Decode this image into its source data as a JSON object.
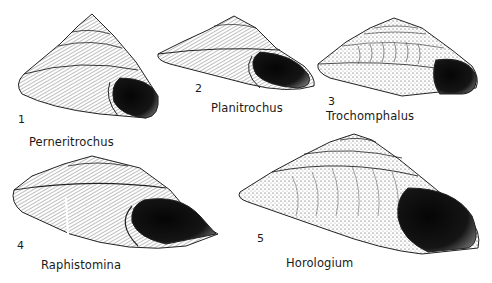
{
  "plate": {
    "background": "#ffffff",
    "ink_color": "#111111",
    "figures": [
      {
        "number": "1",
        "genus": "Perneritrochus"
      },
      {
        "number": "2",
        "genus": "Planitrochus"
      },
      {
        "number": "3",
        "genus": "Trochomphalus"
      },
      {
        "number": "4",
        "genus": "Raphistomina"
      },
      {
        "number": "5",
        "genus": "Horologium"
      }
    ]
  }
}
